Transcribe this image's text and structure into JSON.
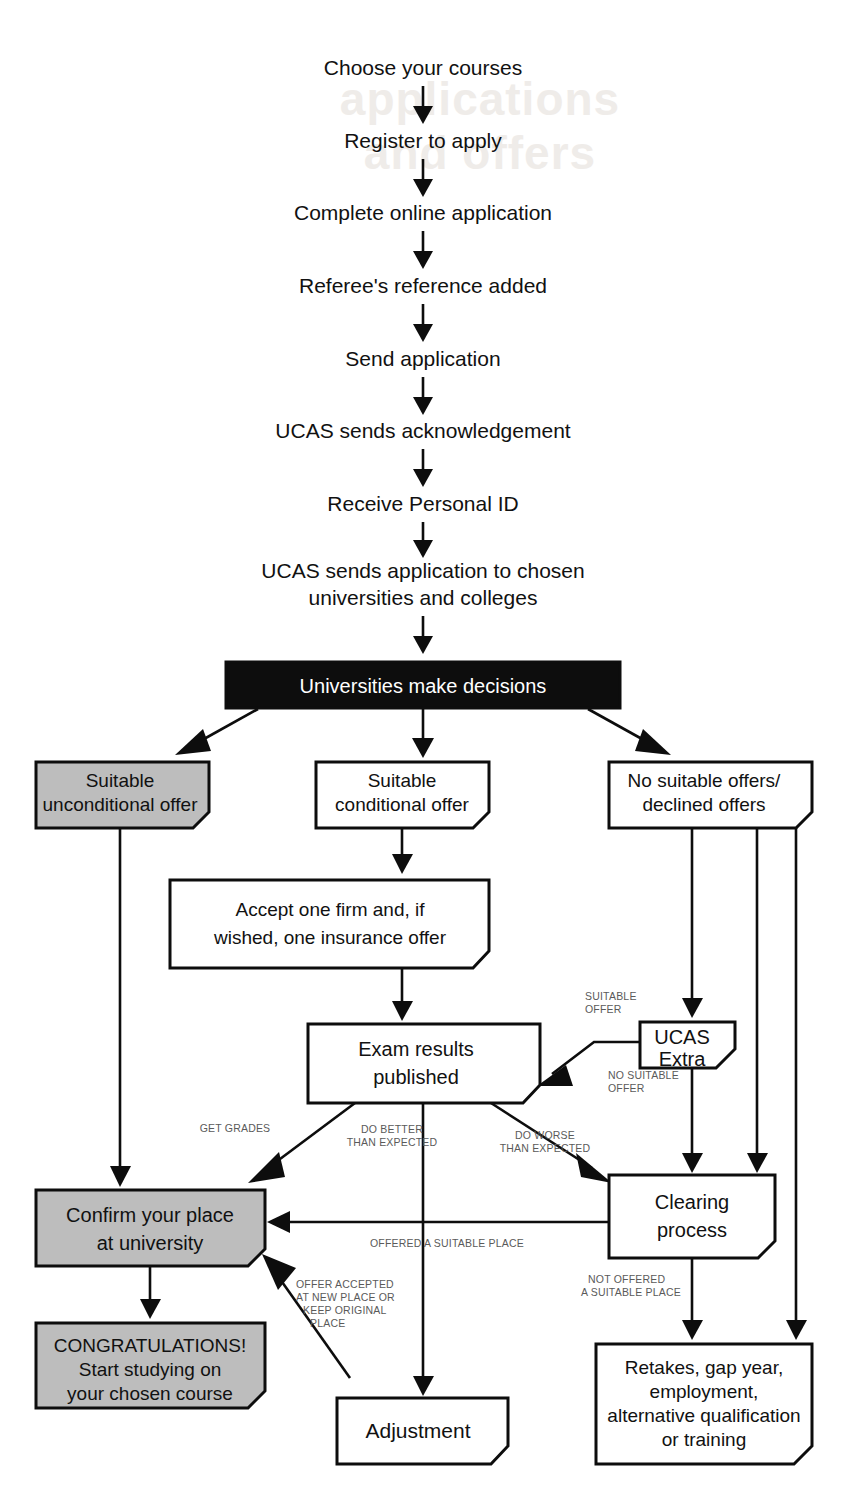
{
  "diagram": {
    "colors": {
      "ink": "#0d0d0d",
      "gray_fill": "#bdbdbd",
      "black_fill": "#0d0d0d",
      "label_gray": "#5a5a5a",
      "page": "#ffffff"
    }
  },
  "watermark": {
    "line1": "applications",
    "line2": "and offers"
  },
  "linear_steps": [
    {
      "id": "choose",
      "text": "Choose your courses"
    },
    {
      "id": "register",
      "text": "Register to apply"
    },
    {
      "id": "complete",
      "text": "Complete online application"
    },
    {
      "id": "referee",
      "text": "Referee's reference added"
    },
    {
      "id": "send",
      "text": "Send application"
    },
    {
      "id": "ack",
      "text": "UCAS sends acknowledgement"
    },
    {
      "id": "personal_id",
      "text": "Receive Personal ID"
    }
  ],
  "send_to_unis": {
    "line1": "UCAS sends application to chosen",
    "line2": "universities and colleges"
  },
  "decision_box": {
    "label": "Universities make decisions"
  },
  "branch_boxes": {
    "unconditional": {
      "line1": "Suitable",
      "line2": "unconditional offer",
      "fill": "gray"
    },
    "conditional": {
      "line1": "Suitable",
      "line2": "conditional offer",
      "fill": "white"
    },
    "no_offers": {
      "line1": "No suitable offers/",
      "line2": "declined offers",
      "fill": "white"
    }
  },
  "accept_box": {
    "line1": "Accept one firm and, if",
    "line2": "wished, one insurance offer"
  },
  "ucas_extra": {
    "line1": "UCAS",
    "line2": "Extra"
  },
  "exam_results": {
    "line1": "Exam results",
    "line2": "published"
  },
  "confirm_place": {
    "line1": "Confirm your place",
    "line2": "at university",
    "fill": "gray"
  },
  "clearing": {
    "line1": "Clearing",
    "line2": "process"
  },
  "congratulations": {
    "line1": "CONGRATULATIONS!",
    "line2": "Start studying on",
    "line3": "your chosen course",
    "fill": "gray"
  },
  "adjustment": {
    "label": "Adjustment"
  },
  "retakes": {
    "line1": "Retakes, gap year,",
    "line2": "employment,",
    "line3": "alternative qualification",
    "line4": "or training"
  },
  "edge_labels": {
    "suitable_offer_1": "SUITABLE",
    "suitable_offer_2": "OFFER",
    "no_suitable_offer_1": "NO SUITABLE",
    "no_suitable_offer_2": "OFFER",
    "get_grades": "GET GRADES",
    "do_better_1": "DO BETTER",
    "do_better_2": "THAN EXPECTED",
    "do_worse_1": "DO WORSE",
    "do_worse_2": "THAN EXPECTED",
    "offered_suitable_place": "OFFERED A SUITABLE PLACE",
    "offer_accepted_1": "OFFER ACCEPTED",
    "offer_accepted_2": "AT NEW PLACE OR",
    "offer_accepted_3": "KEEP ORIGINAL",
    "offer_accepted_4": "PLACE",
    "not_offered_1": "NOT OFFERED",
    "not_offered_2": "A SUITABLE PLACE"
  }
}
